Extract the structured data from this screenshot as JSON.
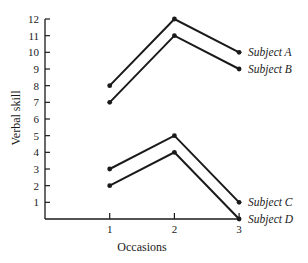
{
  "chart_data": {
    "type": "line",
    "title": "",
    "xlabel": "Occasions",
    "ylabel": "Verbal skill",
    "x": [
      1,
      2,
      3
    ],
    "x_tick_labels": [
      "1",
      "2",
      "3"
    ],
    "y_tick_labels": [
      "1",
      "2",
      "3",
      "4",
      "5",
      "6",
      "7",
      "8",
      "9",
      "10",
      "11",
      "12"
    ],
    "xlim": [
      0,
      3
    ],
    "ylim": [
      0,
      12
    ],
    "grid": false,
    "legend_position": "inline-right",
    "series": [
      {
        "name": "Subject A",
        "values": [
          8,
          12,
          10
        ]
      },
      {
        "name": "Subject B",
        "values": [
          7,
          11,
          9
        ]
      },
      {
        "name": "Subject C",
        "values": [
          3,
          5,
          1
        ]
      },
      {
        "name": "Subject D",
        "values": [
          2,
          4,
          0
        ]
      }
    ]
  },
  "colors": {
    "line": "#1a1a1a",
    "background": "#ffffff"
  }
}
